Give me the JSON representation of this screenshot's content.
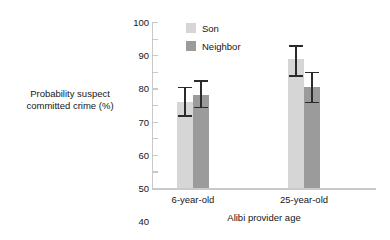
{
  "chart_data": {
    "type": "bar",
    "title": "",
    "xlabel": "Alibi provider age",
    "ylabel": "Probability suspect committed crime (%)",
    "ylabel_line1": "Probability suspect",
    "ylabel_line2": "committed crime (%)",
    "categories": [
      "6-year-old",
      "25-year-old"
    ],
    "ylim": [
      0,
      100
    ],
    "ytick_step": 10,
    "yticks": [
      "100",
      "90",
      "80",
      "70",
      "60",
      "50",
      "40",
      "30",
      "20",
      "10",
      "0"
    ],
    "grid": false,
    "legend_position": "top-left-inside",
    "series": [
      {
        "name": "Son",
        "color": "#d6d6d6",
        "values": [
          52,
          78
        ],
        "error_upper": [
          61,
          86
        ],
        "error_lower": [
          43,
          67
        ]
      },
      {
        "name": "Neighbor",
        "color": "#9b9b9b",
        "values": [
          56,
          61
        ],
        "error_upper": [
          65,
          70
        ],
        "error_lower": [
          48,
          51
        ]
      }
    ]
  },
  "axis": {
    "line_color": "#c9c9c9",
    "text_color": "#161616"
  }
}
